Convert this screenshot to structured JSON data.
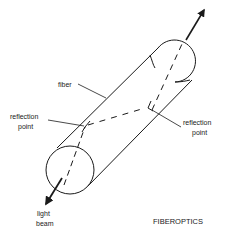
{
  "diagram": {
    "title": "FIBEROPTICS",
    "labels": {
      "fiber": "fiber",
      "reflection_left_line1": "reflection",
      "reflection_left_line2": "point",
      "reflection_right_line1": "reflection",
      "reflection_right_line2": "point",
      "light_line1": "light",
      "light_line2": "beam"
    },
    "colors": {
      "stroke": "#1a1a1a",
      "background": "#ffffff"
    }
  }
}
